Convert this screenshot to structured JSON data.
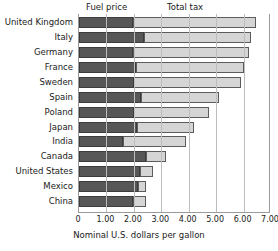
{
  "chart_data": {
    "type": "bar",
    "orientation": "horizontal",
    "stacked": true,
    "title": "",
    "xlabel": "Nominal U.S. dollars per gallon",
    "ylabel": "",
    "xlim": [
      0,
      7
    ],
    "xticks": [
      0,
      1,
      2,
      3,
      4,
      5,
      6,
      7
    ],
    "xticklabels": [
      "0",
      "1.00",
      "2.00",
      "3.00",
      "4.00",
      "5.00",
      "6.00",
      "7.00"
    ],
    "grid": true,
    "grid_axis": "x",
    "legend": [
      "Fuel price",
      "Total tax"
    ],
    "legend_position": "top",
    "categories": [
      "United Kingdom",
      "Italy",
      "Germany",
      "France",
      "Sweden",
      "Spain",
      "Poland",
      "Japan",
      "India",
      "Canada",
      "United States",
      "Mexico",
      "China"
    ],
    "series": [
      {
        "name": "Fuel price",
        "color": "#575757",
        "values": [
          1.97,
          2.37,
          1.97,
          2.08,
          2.0,
          2.26,
          2.0,
          2.11,
          1.6,
          2.44,
          2.22,
          2.15,
          1.97
        ]
      },
      {
        "name": "Total tax",
        "color": "#d5d5d5",
        "values": [
          4.49,
          3.9,
          4.23,
          3.94,
          3.9,
          2.85,
          2.74,
          2.08,
          2.3,
          0.73,
          0.47,
          0.29,
          0.47
        ]
      }
    ],
    "totals": [
      6.46,
      6.27,
      6.2,
      6.02,
      5.9,
      5.11,
      4.74,
      4.19,
      3.9,
      3.17,
      2.69,
      2.44,
      2.44
    ]
  },
  "legend": {
    "fuel_price": "Fuel price",
    "total_tax": "Total tax"
  },
  "axis": {
    "xlabel": "Nominal U.S. dollars per gallon"
  }
}
